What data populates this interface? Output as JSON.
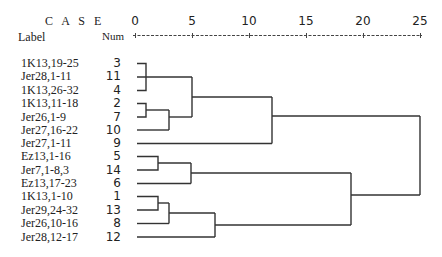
{
  "header": {
    "case_title": "C A S E",
    "label_col": "Label",
    "num_col": "Num"
  },
  "axis": {
    "ticks": [
      "0",
      "5",
      "10",
      "15",
      "20",
      "25"
    ],
    "min": 0,
    "max": 25
  },
  "rows": [
    {
      "label": "1K13,19-25",
      "num": "3"
    },
    {
      "label": "Jer28,1-11",
      "num": "11"
    },
    {
      "label": "1K13,26-32",
      "num": "4"
    },
    {
      "label": "1K13,11-18",
      "num": "2"
    },
    {
      "label": "Jer26,1-9",
      "num": "7"
    },
    {
      "label": "Jer27,16-22",
      "num": "10"
    },
    {
      "label": "Jer27,1-11",
      "num": "9"
    },
    {
      "label": "Ez13,1-16",
      "num": "5"
    },
    {
      "label": "Jer7,1-8,3",
      "num": "14"
    },
    {
      "label": "Ez13,17-23",
      "num": "6"
    },
    {
      "label": "1K13,1-10",
      "num": "1"
    },
    {
      "label": "Jer29,24-32",
      "num": "13"
    },
    {
      "label": "Jer26,10-16",
      "num": "8"
    },
    {
      "label": "Jer28,12-17",
      "num": "12"
    }
  ],
  "merges": [
    {
      "members": [
        "3",
        "11",
        "4"
      ],
      "distance": 1
    },
    {
      "members": [
        "2",
        "7"
      ],
      "distance": 1
    },
    {
      "members": [
        "2,7",
        "10"
      ],
      "distance": 3
    },
    {
      "members": [
        "3,11,4",
        "2,7,10"
      ],
      "distance": 5
    },
    {
      "members": [
        "3,11,4,2,7,10",
        "9"
      ],
      "distance": 12
    },
    {
      "members": [
        "5",
        "14"
      ],
      "distance": 2
    },
    {
      "members": [
        "5,14",
        "6"
      ],
      "distance": 5
    },
    {
      "members": [
        "1",
        "13"
      ],
      "distance": 2
    },
    {
      "members": [
        "1,13",
        "8"
      ],
      "distance": 3
    },
    {
      "members": [
        "1,13,8",
        "12"
      ],
      "distance": 7
    },
    {
      "members": [
        "5,14,6",
        "1,13,8,12"
      ],
      "distance": 19
    },
    {
      "members": [
        "upper",
        "lower"
      ],
      "distance": 25
    }
  ]
}
